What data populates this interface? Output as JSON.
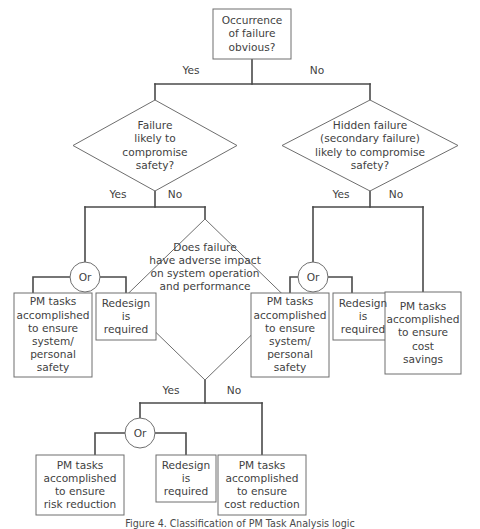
{
  "diagram": {
    "title_caption": "Figure 4. Classification of PM Task Analysis logic",
    "colors": {
      "background": "#ffffff",
      "shape_stroke": "#6e6e6e",
      "connector": "#4a4a4a",
      "text": "#3f3f3f"
    },
    "nodes": {
      "start": {
        "shape": "rectangle",
        "text": "Occurrence\nof failure\nobvious?"
      },
      "left_decision": {
        "shape": "diamond",
        "text": "Failure\nlikely to\ncompromise\nsafety?"
      },
      "right_decision": {
        "shape": "diamond",
        "text": "Hidden failure\n(secondary failure)\nlikely to compromise\nsafety?"
      },
      "center_decision": {
        "shape": "diamond",
        "text": "Does failure\nhave adverse impact\non system operation\nand performance"
      },
      "left_pm": {
        "shape": "rectangle",
        "text": "PM tasks\naccomplished\nto ensure\nsystem/\npersonal\nsafety"
      },
      "left_redesign": {
        "shape": "rectangle",
        "text": "Redesign\nis\nrequired"
      },
      "right_pm": {
        "shape": "rectangle",
        "text": "PM tasks\naccomplished\nto ensure\nsystem/\npersonal\nsafety"
      },
      "right_redesign": {
        "shape": "rectangle",
        "text": "Redesign\nis\nrequired"
      },
      "cost_savings": {
        "shape": "rectangle",
        "text": "PM tasks\naccomplished\nto ensure\ncost\nsavings"
      },
      "risk_reduction": {
        "shape": "rectangle",
        "text": "PM tasks\naccomplished\nto ensure\nrisk reduction"
      },
      "bottom_redesign": {
        "shape": "rectangle",
        "text": "Redesign\nis\nrequired"
      },
      "cost_reduction": {
        "shape": "rectangle",
        "text": "PM tasks\naccomplished\nto ensure\ncost reduction"
      }
    },
    "or_gates": {
      "left": "Or",
      "right": "Or",
      "bottom": "Or"
    },
    "edge_labels": {
      "start_yes": "Yes",
      "start_no": "No",
      "left_yes": "Yes",
      "left_no": "No",
      "right_yes": "Yes",
      "right_no": "No",
      "center_yes": "Yes",
      "center_no": "No"
    }
  }
}
